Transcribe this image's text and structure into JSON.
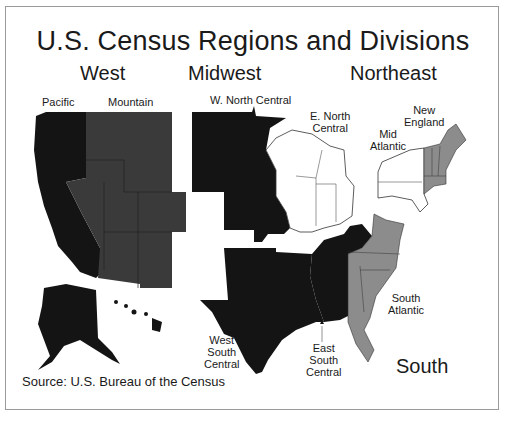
{
  "title": "U.S. Census Regions and Divisions",
  "regions": {
    "west": "West",
    "midwest": "Midwest",
    "northeast": "Northeast",
    "south": "South"
  },
  "divisions": {
    "pacific": "Pacific",
    "mountain": "Mountain",
    "w_north_central": "W. North Central",
    "e_north_central_1": "E. North",
    "e_north_central_2": "Central",
    "mid_atlantic_1": "Mid",
    "mid_atlantic_2": "Atlantic",
    "new_england_1": "New",
    "new_england_2": "England",
    "south_atlantic_1": "South",
    "south_atlantic_2": "Atlantic",
    "west_south_central_1": "West",
    "west_south_central_2": "South",
    "west_south_central_3": "Central",
    "east_south_central_1": "East",
    "east_south_central_2": "South",
    "east_south_central_3": "Central"
  },
  "source": "Source: U.S. Bureau of the Census",
  "colors": {
    "pacific": "#141414",
    "mountain": "#3a3a3a",
    "w_north_central": "#141414",
    "e_north_central": "#ffffff",
    "mid_atlantic": "#ffffff",
    "new_england": "#8c8c8c",
    "west_south_central": "#141414",
    "east_south_central": "#141414",
    "south_atlantic": "#8c8c8c"
  }
}
